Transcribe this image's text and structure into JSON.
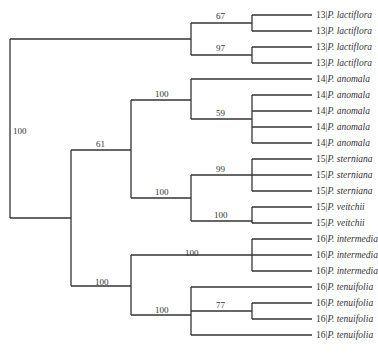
{
  "tree": {
    "tips": [
      {
        "prefix": "13|",
        "species": "P. lactiflora"
      },
      {
        "prefix": "13|",
        "species": "P. lactiflora"
      },
      {
        "prefix": "13|",
        "species": "P. lactiflora"
      },
      {
        "prefix": "13|",
        "species": "P. lactiflora"
      },
      {
        "prefix": "14|",
        "species": "P. anomala"
      },
      {
        "prefix": "14|",
        "species": "P. anomala"
      },
      {
        "prefix": "14|",
        "species": "P. anomala"
      },
      {
        "prefix": "14|",
        "species": "P. anomala"
      },
      {
        "prefix": "14|",
        "species": "P. anomala"
      },
      {
        "prefix": "15|",
        "species": "P. sterniana"
      },
      {
        "prefix": "15|",
        "species": "P. sterniana"
      },
      {
        "prefix": "15|",
        "species": "P. sterniana"
      },
      {
        "prefix": "15|",
        "species": "P. veitchii"
      },
      {
        "prefix": "15|",
        "species": "P. veitchii"
      },
      {
        "prefix": "16|",
        "species": "P. intermedia"
      },
      {
        "prefix": "16|",
        "species": "P. intermedia"
      },
      {
        "prefix": "16|",
        "species": "P. intermedia"
      },
      {
        "prefix": "16|",
        "species": "P. tenuifolia"
      },
      {
        "prefix": "16|",
        "species": "P. tenuifolia"
      },
      {
        "prefix": "16|",
        "species": "P. tenuifolia"
      },
      {
        "prefix": "16|",
        "species": "P. tenuifolia"
      }
    ],
    "support": {
      "root": "100",
      "lactiflora_a": "67",
      "lactiflora_b": "97",
      "core": "61",
      "anomala": "100",
      "anomala_inner": "59",
      "sterniana_veitchii": "100",
      "sterniana": "99",
      "veitchii": "100",
      "intermedia_tenuifolia": "100",
      "intermedia": "100",
      "tenuifolia": "100",
      "tenuifolia_inner": "77"
    }
  }
}
